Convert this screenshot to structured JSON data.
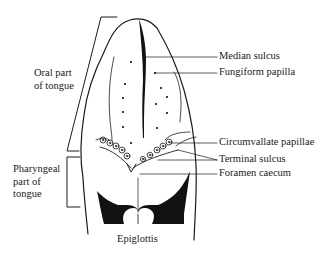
{
  "figure": {
    "colors": {
      "ink": "#1a1a1a",
      "background": "#ffffff",
      "fill_dark": "#111111"
    }
  },
  "labels": {
    "left": {
      "oral": {
        "line1": "Oral part",
        "line2": "of tongue"
      },
      "pharyngeal": {
        "line1": "Pharyngeal",
        "line2": "part of",
        "line3": "tongue"
      }
    },
    "right": [
      {
        "text": "Median sulcus"
      },
      {
        "text": "Fungiform papilla"
      },
      {
        "text": "Circumvallate papillae"
      },
      {
        "text": "Terminal sulcus"
      },
      {
        "text": "Foramen caecum"
      }
    ],
    "bottom": {
      "text": "Epiglottis"
    }
  }
}
